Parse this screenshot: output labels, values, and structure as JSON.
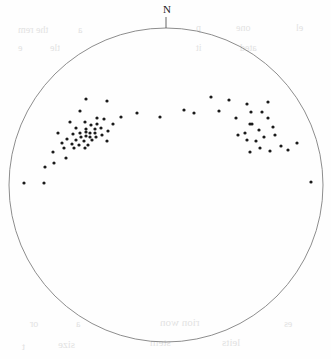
{
  "figure": {
    "type": "stereonet-scatter-plot",
    "width": 331,
    "height": 359,
    "background_color": "#ffffff"
  },
  "primitive_circle": {
    "center_x": 166,
    "center_y": 185,
    "radius": 157,
    "stroke_color": "#808080",
    "stroke_width": 0.9,
    "fill": "none"
  },
  "north_marker": {
    "label": "N",
    "label_x": 163,
    "label_y": 4,
    "tick_x": 166,
    "tick_y1": 17,
    "tick_y2": 28,
    "stroke_color": "#555555"
  },
  "points_style": {
    "color": "#1a1a1a",
    "radius": 1.6,
    "shape": "filled-circle"
  },
  "bleed_through_text": [
    {
      "text": "the rem",
      "x": 18,
      "y": 24,
      "size": 10
    },
    {
      "text": "a",
      "x": 78,
      "y": 24,
      "size": 10
    },
    {
      "text": "p",
      "x": 196,
      "y": 22,
      "size": 10
    },
    {
      "text": "one",
      "x": 236,
      "y": 22,
      "size": 10
    },
    {
      "text": "el",
      "x": 296,
      "y": 22,
      "size": 10
    },
    {
      "text": "e",
      "x": 18,
      "y": 42,
      "size": 10
    },
    {
      "text": "tle",
      "x": 50,
      "y": 42,
      "size": 10
    },
    {
      "text": "it",
      "x": 196,
      "y": 42,
      "size": 10
    },
    {
      "text": "ated",
      "x": 240,
      "y": 42,
      "size": 10
    },
    {
      "text": "or",
      "x": 30,
      "y": 318,
      "size": 10
    },
    {
      "text": "a",
      "x": 76,
      "y": 318,
      "size": 10
    },
    {
      "text": "rion won",
      "x": 160,
      "y": 316,
      "size": 11
    },
    {
      "text": "es",
      "x": 284,
      "y": 318,
      "size": 10
    },
    {
      "text": "t",
      "x": 22,
      "y": 340,
      "size": 11
    },
    {
      "text": "size",
      "x": 58,
      "y": 338,
      "size": 11
    },
    {
      "text": "stem",
      "x": 150,
      "y": 336,
      "size": 11
    },
    {
      "text": "leits",
      "x": 222,
      "y": 336,
      "size": 11
    }
  ],
  "chart_data": {
    "type": "scatter",
    "title": "",
    "xlabel": "",
    "ylabel": "",
    "projection": "equal-area stereographic (lower hemisphere)",
    "grid": false,
    "legend": null,
    "annotations": [
      {
        "text": "N",
        "x": 166,
        "y": 10,
        "role": "north-azimuth-marker"
      }
    ],
    "axis_ranges": {
      "note": "Circular plot; coordinates given in pixel space of the 331x359 figure",
      "center": [
        166,
        185
      ],
      "radius": 157
    },
    "point_count": 75,
    "points": [
      [
        86,
        99
      ],
      [
        107,
        101
      ],
      [
        80,
        111
      ],
      [
        97,
        118
      ],
      [
        104,
        119
      ],
      [
        70,
        122
      ],
      [
        85,
        122
      ],
      [
        91,
        125
      ],
      [
        97,
        124
      ],
      [
        113,
        124
      ],
      [
        76,
        128
      ],
      [
        86,
        129
      ],
      [
        95,
        129
      ],
      [
        101,
        128
      ],
      [
        108,
        131
      ],
      [
        58,
        133
      ],
      [
        73,
        134
      ],
      [
        80,
        133
      ],
      [
        86,
        132
      ],
      [
        90,
        133
      ],
      [
        95,
        133
      ],
      [
        81,
        137
      ],
      [
        86,
        136
      ],
      [
        90,
        137
      ],
      [
        96,
        137
      ],
      [
        102,
        135
      ],
      [
        67,
        139
      ],
      [
        76,
        140
      ],
      [
        84,
        141
      ],
      [
        92,
        140
      ],
      [
        107,
        141
      ],
      [
        62,
        143
      ],
      [
        72,
        144
      ],
      [
        79,
        145
      ],
      [
        88,
        145
      ],
      [
        53,
        152
      ],
      [
        64,
        148
      ],
      [
        74,
        148
      ],
      [
        85,
        148
      ],
      [
        54,
        163
      ],
      [
        45,
        167
      ],
      [
        66,
        158
      ],
      [
        24,
        183
      ],
      [
        44,
        183
      ],
      [
        121,
        117
      ],
      [
        137,
        113
      ],
      [
        160,
        117
      ],
      [
        184,
        110
      ],
      [
        211,
        97
      ],
      [
        229,
        100
      ],
      [
        194,
        113
      ],
      [
        219,
        111
      ],
      [
        236,
        118
      ],
      [
        247,
        104
      ],
      [
        251,
        112
      ],
      [
        252,
        124
      ],
      [
        262,
        112
      ],
      [
        268,
        102
      ],
      [
        245,
        133
      ],
      [
        250,
        124
      ],
      [
        259,
        130
      ],
      [
        268,
        118
      ],
      [
        273,
        127
      ],
      [
        238,
        135
      ],
      [
        247,
        140
      ],
      [
        256,
        141
      ],
      [
        264,
        137
      ],
      [
        275,
        135
      ],
      [
        250,
        152
      ],
      [
        260,
        148
      ],
      [
        270,
        151
      ],
      [
        281,
        146
      ],
      [
        288,
        150
      ],
      [
        297,
        143
      ],
      [
        311,
        182
      ]
    ]
  }
}
